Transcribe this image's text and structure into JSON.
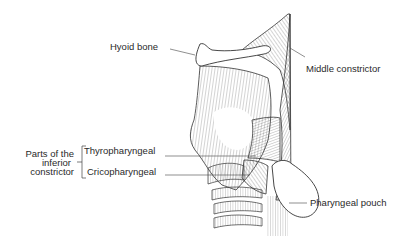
{
  "figure": {
    "labels": {
      "hyoid_bone": "Hyoid bone",
      "middle_constrictor": "Middle constrictor",
      "group_line1": "Parts of the",
      "group_line2": "inferior",
      "group_line3": "constrictor",
      "thyropharyngeal": "Thyropharyngeal",
      "cricopharyngeal": "Cricopharyngeal",
      "pharyngeal_pouch": "Pharyngeal pouch"
    },
    "colors": {
      "ink": "#2a2a2a",
      "background": "#ffffff"
    }
  }
}
